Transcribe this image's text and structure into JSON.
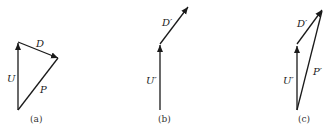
{
  "panels": [
    {
      "caption": "(a)",
      "vectors": [
        {
          "name": "U",
          "label": "U"
        },
        {
          "name": "D",
          "label": "D"
        },
        {
          "name": "P",
          "label": "P"
        }
      ]
    },
    {
      "caption": "(b)",
      "vectors": [
        {
          "name": "U'",
          "label": "U′"
        },
        {
          "name": "D'",
          "label": "D′"
        }
      ]
    },
    {
      "caption": "(c)",
      "vectors": [
        {
          "name": "U'",
          "label": "U′"
        },
        {
          "name": "D'",
          "label": "D′"
        },
        {
          "name": "P'",
          "label": "P′"
        }
      ]
    }
  ],
  "colors": {
    "stroke": "#1a1a1a",
    "background": "#ffffff"
  }
}
